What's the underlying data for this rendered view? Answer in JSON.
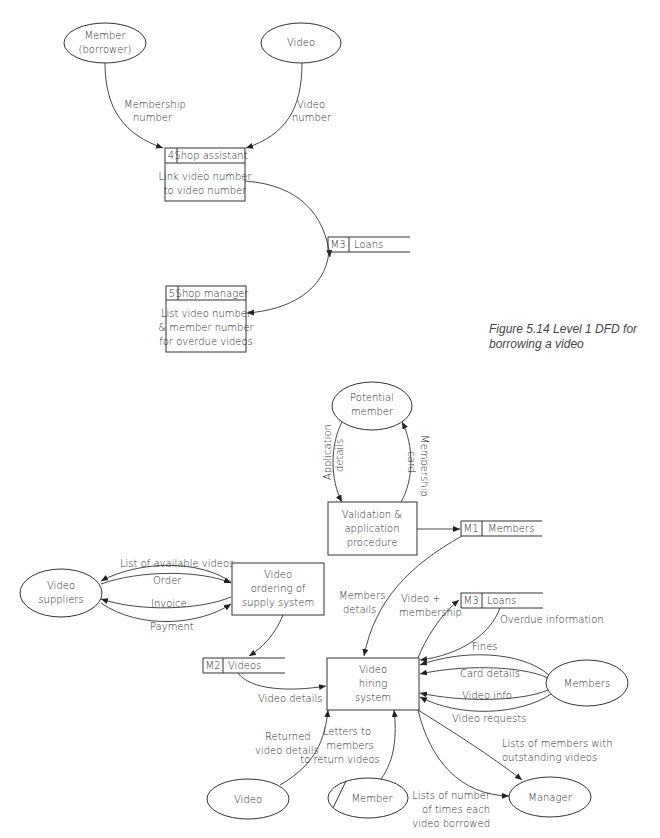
{
  "figure": {
    "caption_line1": "Figure 5.14  Level 1 DFD for",
    "caption_line2": "borrowing a video"
  },
  "top_diagram": {
    "entities": {
      "member_borrower": {
        "line1": "Member",
        "line2": "(borrower)"
      },
      "video": {
        "label": "Video"
      }
    },
    "processes": {
      "p4": {
        "id": "4",
        "owner": "Shop assistant",
        "line1": "Link video number",
        "line2": "to video number"
      },
      "p5": {
        "id": "5",
        "owner": "Shop manager",
        "line1": "List video number",
        "line2": "& member number",
        "line3": "for overdue videos"
      }
    },
    "stores": {
      "m3": {
        "id": "M3",
        "label": "Loans"
      }
    },
    "flows": {
      "membership_number": {
        "line1": "Membership",
        "line2": "number"
      },
      "video_number": {
        "line1": "Video",
        "line2": "number"
      }
    }
  },
  "bottom_diagram": {
    "entities": {
      "potential_member": {
        "line1": "Potential",
        "line2": "member"
      },
      "video_suppliers": {
        "line1": "Video",
        "line2": "suppliers"
      },
      "members": {
        "label": "Members"
      },
      "video": {
        "label": "Video"
      },
      "member": {
        "label": "Member"
      },
      "manager": {
        "label": "Manager"
      }
    },
    "processes": {
      "validation": {
        "line1": "Validation &",
        "line2": "application",
        "line3": "procedure"
      },
      "ordering": {
        "line1": "Video",
        "line2": "ordering of",
        "line3": "supply system"
      },
      "hiring": {
        "line1": "Video",
        "line2": "hiring",
        "line3": "system"
      }
    },
    "stores": {
      "m1": {
        "id": "M1",
        "label": "Members"
      },
      "m2": {
        "id": "M2",
        "label": "Videos"
      },
      "m3": {
        "id": "M3",
        "label": "Loans"
      }
    },
    "flows": {
      "application_details": {
        "line1": "Application",
        "line2": "details"
      },
      "membership_card": {
        "line1": "Membership",
        "line2": "card"
      },
      "list_available": {
        "label": "List of available videos"
      },
      "order": {
        "label": "Order"
      },
      "invoice": {
        "label": "Invoice"
      },
      "payment": {
        "label": "Payment"
      },
      "members_details": {
        "line1": "Members",
        "line2": "details"
      },
      "video_membership": {
        "line1": "Video +",
        "line2": "membership"
      },
      "overdue_information": {
        "label": "Overdue information"
      },
      "fines": {
        "label": "Fines"
      },
      "card_details": {
        "label": "Card details"
      },
      "video_info": {
        "label": "Video info"
      },
      "video_requests": {
        "label": "Video requests"
      },
      "video_details": {
        "label": "Video details"
      },
      "returned_video_details": {
        "line1": "Returned",
        "line2": "video details"
      },
      "letters_to_members": {
        "line1": "Letters to",
        "line2": "members",
        "line3": "to return videos"
      },
      "lists_outstanding": {
        "line1": "Lists of members with",
        "line2": "outstanding videos"
      },
      "lists_times_borrowed": {
        "line1": "Lists of number",
        "line2": "of times each",
        "line3": "video borrowed"
      }
    }
  },
  "colors": {
    "ink": "#333333",
    "background": "#ffffff"
  }
}
